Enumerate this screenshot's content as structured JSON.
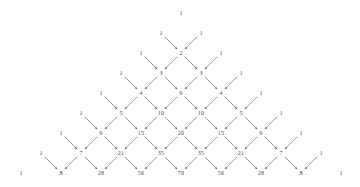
{
  "figure": {
    "background_color": "#ffffff",
    "text_color": "#4d4d4d",
    "arrow_color": "#555555",
    "width": 360,
    "height": 187
  },
  "layout": {
    "apex_x": 181,
    "apex_y": 13,
    "row_height": 20,
    "col_spacing": 40,
    "row_offset": -20
  },
  "chart_data": {
    "type": "diagram",
    "rows": [
      {
        "index": 0,
        "values": [
          1
        ]
      },
      {
        "index": 1,
        "values": [
          1,
          1
        ]
      },
      {
        "index": 2,
        "values": [
          1,
          2,
          1
        ]
      },
      {
        "index": 3,
        "values": [
          1,
          3,
          3,
          1
        ]
      },
      {
        "index": 4,
        "values": [
          1,
          4,
          6,
          4,
          1
        ]
      },
      {
        "index": 5,
        "values": [
          1,
          5,
          10,
          10,
          5,
          1
        ]
      },
      {
        "index": 6,
        "values": [
          1,
          6,
          15,
          20,
          15,
          6,
          1
        ]
      },
      {
        "index": 7,
        "values": [
          1,
          7,
          21,
          35,
          35,
          21,
          7,
          1
        ]
      },
      {
        "index": 8,
        "values": [
          1,
          8,
          28,
          56,
          70,
          56,
          28,
          8,
          1
        ]
      }
    ]
  },
  "nodes": [
    {
      "row": 0,
      "col": 0,
      "label": "1",
      "x": 181,
      "y": 13
    },
    {
      "row": 1,
      "col": 0,
      "label": "1",
      "x": 161,
      "y": 33
    },
    {
      "row": 1,
      "col": 1,
      "label": "1",
      "x": 201,
      "y": 33
    },
    {
      "row": 2,
      "col": 0,
      "label": "1",
      "x": 141,
      "y": 53
    },
    {
      "row": 2,
      "col": 1,
      "label": "2",
      "x": 181,
      "y": 53
    },
    {
      "row": 2,
      "col": 2,
      "label": "1",
      "x": 221,
      "y": 53
    },
    {
      "row": 3,
      "col": 0,
      "label": "1",
      "x": 121,
      "y": 73
    },
    {
      "row": 3,
      "col": 1,
      "label": "3",
      "x": 161,
      "y": 73
    },
    {
      "row": 3,
      "col": 2,
      "label": "3",
      "x": 201,
      "y": 73
    },
    {
      "row": 3,
      "col": 3,
      "label": "1",
      "x": 241,
      "y": 73
    },
    {
      "row": 4,
      "col": 0,
      "label": "1",
      "x": 101,
      "y": 93
    },
    {
      "row": 4,
      "col": 1,
      "label": "4",
      "x": 141,
      "y": 93
    },
    {
      "row": 4,
      "col": 2,
      "label": "6",
      "x": 181,
      "y": 93
    },
    {
      "row": 4,
      "col": 3,
      "label": "4",
      "x": 221,
      "y": 93
    },
    {
      "row": 4,
      "col": 4,
      "label": "1",
      "x": 261,
      "y": 93
    },
    {
      "row": 5,
      "col": 0,
      "label": "1",
      "x": 81,
      "y": 113
    },
    {
      "row": 5,
      "col": 1,
      "label": "5",
      "x": 121,
      "y": 113
    },
    {
      "row": 5,
      "col": 2,
      "label": "10",
      "x": 161,
      "y": 113
    },
    {
      "row": 5,
      "col": 3,
      "label": "10",
      "x": 201,
      "y": 113
    },
    {
      "row": 5,
      "col": 4,
      "label": "5",
      "x": 241,
      "y": 113
    },
    {
      "row": 5,
      "col": 5,
      "label": "1",
      "x": 281,
      "y": 113
    },
    {
      "row": 6,
      "col": 0,
      "label": "1",
      "x": 61,
      "y": 133
    },
    {
      "row": 6,
      "col": 1,
      "label": "6",
      "x": 101,
      "y": 133
    },
    {
      "row": 6,
      "col": 2,
      "label": "15",
      "x": 141,
      "y": 133
    },
    {
      "row": 6,
      "col": 3,
      "label": "20",
      "x": 181,
      "y": 133
    },
    {
      "row": 6,
      "col": 4,
      "label": "15",
      "x": 221,
      "y": 133
    },
    {
      "row": 6,
      "col": 5,
      "label": "6",
      "x": 261,
      "y": 133
    },
    {
      "row": 6,
      "col": 6,
      "label": "1",
      "x": 301,
      "y": 133
    },
    {
      "row": 7,
      "col": 0,
      "label": "1",
      "x": 41,
      "y": 153
    },
    {
      "row": 7,
      "col": 1,
      "label": "7",
      "x": 81,
      "y": 153
    },
    {
      "row": 7,
      "col": 2,
      "label": "21",
      "x": 121,
      "y": 153
    },
    {
      "row": 7,
      "col": 3,
      "label": "35",
      "x": 161,
      "y": 153
    },
    {
      "row": 7,
      "col": 4,
      "label": "35",
      "x": 201,
      "y": 153
    },
    {
      "row": 7,
      "col": 5,
      "label": "21",
      "x": 241,
      "y": 153
    },
    {
      "row": 7,
      "col": 6,
      "label": "7",
      "x": 281,
      "y": 153
    },
    {
      "row": 7,
      "col": 7,
      "label": "1",
      "x": 321,
      "y": 153
    },
    {
      "row": 8,
      "col": 0,
      "label": "1",
      "x": 21,
      "y": 173
    },
    {
      "row": 8,
      "col": 1,
      "label": "8",
      "x": 61,
      "y": 173
    },
    {
      "row": 8,
      "col": 2,
      "label": "28",
      "x": 101,
      "y": 173
    },
    {
      "row": 8,
      "col": 3,
      "label": "56",
      "x": 141,
      "y": 173
    },
    {
      "row": 8,
      "col": 4,
      "label": "70",
      "x": 181,
      "y": 173
    },
    {
      "row": 8,
      "col": 5,
      "label": "56",
      "x": 221,
      "y": 173
    },
    {
      "row": 8,
      "col": 6,
      "label": "28",
      "x": 261,
      "y": 173
    },
    {
      "row": 8,
      "col": 7,
      "label": "8",
      "x": 301,
      "y": 173
    },
    {
      "row": 8,
      "col": 8,
      "label": "1",
      "x": 341,
      "y": 173
    }
  ],
  "edges": [
    {
      "from_row": 1,
      "from_col": 0,
      "to_row": 2,
      "to_col": 1
    },
    {
      "from_row": 1,
      "from_col": 1,
      "to_row": 2,
      "to_col": 1
    },
    {
      "from_row": 2,
      "from_col": 0,
      "to_row": 3,
      "to_col": 1
    },
    {
      "from_row": 2,
      "from_col": 1,
      "to_row": 3,
      "to_col": 1
    },
    {
      "from_row": 2,
      "from_col": 1,
      "to_row": 3,
      "to_col": 2
    },
    {
      "from_row": 2,
      "from_col": 2,
      "to_row": 3,
      "to_col": 2
    },
    {
      "from_row": 3,
      "from_col": 0,
      "to_row": 4,
      "to_col": 1
    },
    {
      "from_row": 3,
      "from_col": 1,
      "to_row": 4,
      "to_col": 1
    },
    {
      "from_row": 3,
      "from_col": 1,
      "to_row": 4,
      "to_col": 2
    },
    {
      "from_row": 3,
      "from_col": 2,
      "to_row": 4,
      "to_col": 2
    },
    {
      "from_row": 3,
      "from_col": 2,
      "to_row": 4,
      "to_col": 3
    },
    {
      "from_row": 3,
      "from_col": 3,
      "to_row": 4,
      "to_col": 3
    },
    {
      "from_row": 4,
      "from_col": 0,
      "to_row": 5,
      "to_col": 1
    },
    {
      "from_row": 4,
      "from_col": 1,
      "to_row": 5,
      "to_col": 1
    },
    {
      "from_row": 4,
      "from_col": 1,
      "to_row": 5,
      "to_col": 2
    },
    {
      "from_row": 4,
      "from_col": 2,
      "to_row": 5,
      "to_col": 2
    },
    {
      "from_row": 4,
      "from_col": 2,
      "to_row": 5,
      "to_col": 3
    },
    {
      "from_row": 4,
      "from_col": 3,
      "to_row": 5,
      "to_col": 3
    },
    {
      "from_row": 4,
      "from_col": 3,
      "to_row": 5,
      "to_col": 4
    },
    {
      "from_row": 4,
      "from_col": 4,
      "to_row": 5,
      "to_col": 4
    },
    {
      "from_row": 5,
      "from_col": 0,
      "to_row": 6,
      "to_col": 1
    },
    {
      "from_row": 5,
      "from_col": 1,
      "to_row": 6,
      "to_col": 1
    },
    {
      "from_row": 5,
      "from_col": 1,
      "to_row": 6,
      "to_col": 2
    },
    {
      "from_row": 5,
      "from_col": 2,
      "to_row": 6,
      "to_col": 2
    },
    {
      "from_row": 5,
      "from_col": 2,
      "to_row": 6,
      "to_col": 3
    },
    {
      "from_row": 5,
      "from_col": 3,
      "to_row": 6,
      "to_col": 3
    },
    {
      "from_row": 5,
      "from_col": 3,
      "to_row": 6,
      "to_col": 4
    },
    {
      "from_row": 5,
      "from_col": 4,
      "to_row": 6,
      "to_col": 4
    },
    {
      "from_row": 5,
      "from_col": 4,
      "to_row": 6,
      "to_col": 5
    },
    {
      "from_row": 5,
      "from_col": 5,
      "to_row": 6,
      "to_col": 5
    },
    {
      "from_row": 6,
      "from_col": 0,
      "to_row": 7,
      "to_col": 1
    },
    {
      "from_row": 6,
      "from_col": 1,
      "to_row": 7,
      "to_col": 1
    },
    {
      "from_row": 6,
      "from_col": 1,
      "to_row": 7,
      "to_col": 2
    },
    {
      "from_row": 6,
      "from_col": 2,
      "to_row": 7,
      "to_col": 2
    },
    {
      "from_row": 6,
      "from_col": 2,
      "to_row": 7,
      "to_col": 3
    },
    {
      "from_row": 6,
      "from_col": 3,
      "to_row": 7,
      "to_col": 3
    },
    {
      "from_row": 6,
      "from_col": 3,
      "to_row": 7,
      "to_col": 4
    },
    {
      "from_row": 6,
      "from_col": 4,
      "to_row": 7,
      "to_col": 4
    },
    {
      "from_row": 6,
      "from_col": 4,
      "to_row": 7,
      "to_col": 5
    },
    {
      "from_row": 6,
      "from_col": 5,
      "to_row": 7,
      "to_col": 5
    },
    {
      "from_row": 6,
      "from_col": 5,
      "to_row": 7,
      "to_col": 6
    },
    {
      "from_row": 6,
      "from_col": 6,
      "to_row": 7,
      "to_col": 6
    },
    {
      "from_row": 7,
      "from_col": 0,
      "to_row": 8,
      "to_col": 1
    },
    {
      "from_row": 7,
      "from_col": 1,
      "to_row": 8,
      "to_col": 1
    },
    {
      "from_row": 7,
      "from_col": 1,
      "to_row": 8,
      "to_col": 2
    },
    {
      "from_row": 7,
      "from_col": 2,
      "to_row": 8,
      "to_col": 2
    },
    {
      "from_row": 7,
      "from_col": 2,
      "to_row": 8,
      "to_col": 3
    },
    {
      "from_row": 7,
      "from_col": 3,
      "to_row": 8,
      "to_col": 3
    },
    {
      "from_row": 7,
      "from_col": 3,
      "to_row": 8,
      "to_col": 4
    },
    {
      "from_row": 7,
      "from_col": 4,
      "to_row": 8,
      "to_col": 4
    },
    {
      "from_row": 7,
      "from_col": 4,
      "to_row": 8,
      "to_col": 5
    },
    {
      "from_row": 7,
      "from_col": 5,
      "to_row": 8,
      "to_col": 5
    },
    {
      "from_row": 7,
      "from_col": 5,
      "to_row": 8,
      "to_col": 6
    },
    {
      "from_row": 7,
      "from_col": 6,
      "to_row": 8,
      "to_col": 6
    },
    {
      "from_row": 7,
      "from_col": 6,
      "to_row": 8,
      "to_col": 7
    },
    {
      "from_row": 7,
      "from_col": 7,
      "to_row": 8,
      "to_col": 7
    }
  ]
}
